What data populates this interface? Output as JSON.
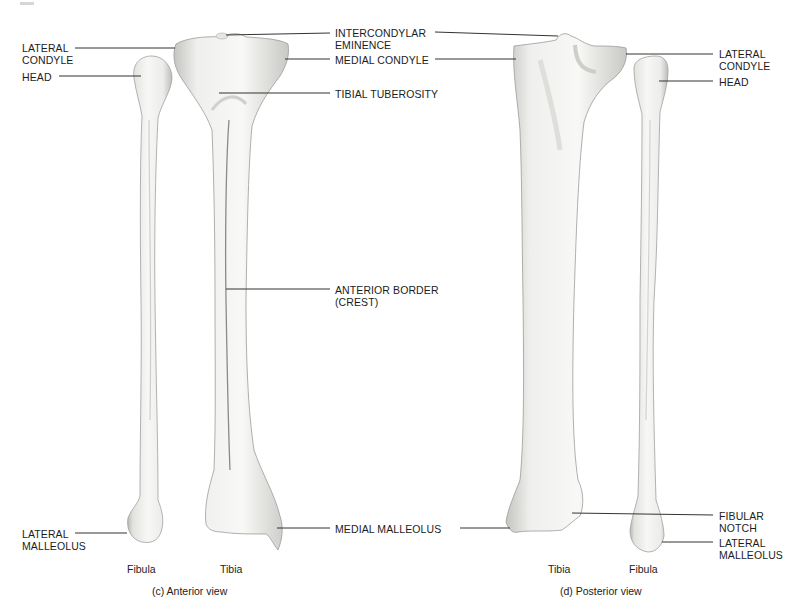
{
  "figure": {
    "panels": [
      {
        "id": "anterior",
        "caption": "(c) Anterior view",
        "bones": [
          "Fibula",
          "Tibia"
        ],
        "labels": {
          "lateral_condyle": "LATERAL\nCONDYLE",
          "head": "HEAD",
          "intercondylar_eminence": "INTERCONDYLAR\nEMINENCE",
          "medial_condyle": "MEDIAL CONDYLE",
          "tibial_tuberosity": "TIBIAL TUBEROSITY",
          "anterior_border": "ANTERIOR BORDER\n(CREST)",
          "lateral_malleolus": "LATERAL\nMALLEOLUS",
          "medial_malleolus": "MEDIAL MALLEOLUS"
        }
      },
      {
        "id": "posterior",
        "caption": "(d) Posterior view",
        "bones": [
          "Tibia",
          "Fibula"
        ],
        "labels": {
          "lateral_condyle": "LATERAL\nCONDYLE",
          "head": "HEAD",
          "fibular_notch": "FIBULAR\nNOTCH",
          "lateral_malleolus": "LATERAL\nMALLEOLUS"
        }
      }
    ],
    "colors": {
      "bone_fill": "#f1f1ef",
      "bone_shade": "#c9c9c6",
      "bone_edge": "#9a9a97",
      "leader_line": "#333333",
      "text": "#1c1c1c"
    }
  }
}
